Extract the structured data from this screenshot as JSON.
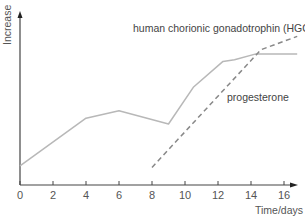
{
  "chart_data": {
    "type": "line",
    "title": "",
    "xlabel": "Time/days",
    "ylabel": "Increase",
    "xlim": [
      0,
      17
    ],
    "ylim": [
      0,
      100
    ],
    "x_ticks": [
      0,
      2,
      4,
      6,
      8,
      10,
      12,
      14,
      16
    ],
    "x_tick_labels": [
      "0",
      "2",
      "4",
      "6",
      "8",
      "10",
      "12",
      "14",
      "16"
    ],
    "y_ticks": [],
    "grid": false,
    "legend": "none (inline annotations)",
    "series": [
      {
        "name": "progesterone",
        "style": "solid",
        "color": "#b8b8b8",
        "x": [
          0,
          4,
          6,
          9,
          10.5,
          12.3,
          13,
          14.3,
          16.8
        ],
        "y": [
          11.5,
          40,
          44.5,
          36.5,
          58.5,
          74,
          75,
          78.5,
          78.5
        ]
      },
      {
        "name": "human chorionic gonadotrophin (HGC)",
        "style": "dashed",
        "color": "#888888",
        "x": [
          8,
          14.6,
          16.8
        ],
        "y": [
          10.5,
          81,
          89
        ]
      }
    ],
    "annotations": [
      {
        "text": "human chorionic gonadotrophin (HGC)",
        "points_to": "dashed line"
      },
      {
        "text": "progesterone",
        "points_to": "solid line"
      }
    ]
  },
  "labels": {
    "y_axis": "Increase",
    "x_axis": "Time/days",
    "hcg": "human chorionic gonadotrophin (HGC)",
    "progesterone": "progesterone"
  },
  "colors": {
    "axis": "#444444",
    "solid_line": "#b8b8b8",
    "dashed_line": "#888888",
    "text": "#555555"
  }
}
